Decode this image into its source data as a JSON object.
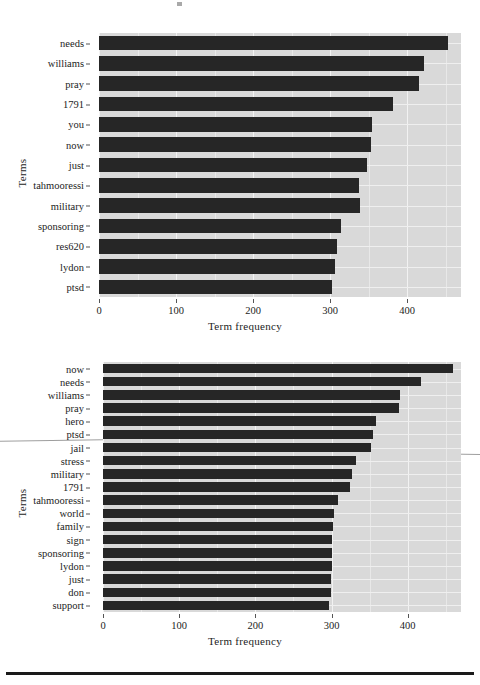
{
  "figure": {
    "axis_titles": {
      "x": "Term frequency",
      "y": "Terms"
    }
  },
  "chart_data": [
    {
      "id": "top",
      "type": "bar",
      "orientation": "horizontal",
      "title": "",
      "xlabel": "Term frequency",
      "ylabel": "Terms",
      "xlim": [
        0,
        470
      ],
      "xticks": [
        0,
        100,
        200,
        300,
        400
      ],
      "grid": true,
      "legend": "none",
      "categories": [
        "needs",
        "williams",
        "pray",
        "1791",
        "you",
        "now",
        "just",
        "tahmooressi",
        "military",
        "sponsoring",
        "res620",
        "lydon",
        "ptsd"
      ],
      "values": [
        453,
        422,
        415,
        382,
        354,
        353,
        348,
        338,
        339,
        314,
        309,
        307,
        302
      ]
    },
    {
      "id": "bottom",
      "type": "bar",
      "orientation": "horizontal",
      "title": "",
      "xlabel": "Term frequency",
      "ylabel": "Terms",
      "xlim": [
        0,
        470
      ],
      "xticks": [
        0,
        100,
        200,
        300,
        400
      ],
      "grid": true,
      "legend": "none",
      "categories": [
        "now",
        "needs",
        "williams",
        "pray",
        "hero",
        "ptsd",
        "jail",
        "stress",
        "military",
        "1791",
        "tahmooressi",
        "world",
        "family",
        "sign",
        "sponsoring",
        "lydon",
        "just",
        "don",
        "support"
      ],
      "values": [
        460,
        418,
        390,
        388,
        358,
        355,
        352,
        332,
        327,
        324,
        309,
        303,
        302,
        301,
        300,
        300,
        299,
        299,
        297
      ]
    }
  ]
}
